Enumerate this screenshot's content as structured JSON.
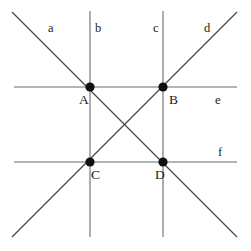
{
  "figure": {
    "canvas": {
      "width": 251,
      "height": 251,
      "background": "#ffffff"
    },
    "colors": {
      "line": "#6b6b6b",
      "diagonal": "#4a4a4a",
      "point": "#111111",
      "text": "#1a1a1a"
    },
    "lines": [
      {
        "id": "a",
        "label": "a",
        "kind": "diagonal",
        "x1": 12,
        "y1": 12,
        "x2": 237,
        "y2": 237
      },
      {
        "id": "b",
        "label": "b",
        "kind": "vertical",
        "x1": 90,
        "y1": 11,
        "x2": 90,
        "y2": 237
      },
      {
        "id": "c",
        "label": "c",
        "kind": "vertical",
        "x1": 163,
        "y1": 11,
        "x2": 163,
        "y2": 237
      },
      {
        "id": "d",
        "label": "d",
        "kind": "diagonal",
        "x1": 12,
        "y1": 237,
        "x2": 237,
        "y2": 12
      },
      {
        "id": "e",
        "label": "e",
        "kind": "horizontal",
        "x1": 14,
        "y1": 87,
        "x2": 237,
        "y2": 87
      },
      {
        "id": "f",
        "label": "f",
        "kind": "horizontal",
        "x1": 14,
        "y1": 162,
        "x2": 237,
        "y2": 162
      }
    ],
    "line_labels": [
      {
        "id": "label-a",
        "text": "a",
        "x": 48,
        "y": 22
      },
      {
        "id": "label-b",
        "text": "b",
        "x": 95,
        "y": 22
      },
      {
        "id": "label-c",
        "text": "c",
        "x": 153,
        "y": 22
      },
      {
        "id": "label-d",
        "text": "d",
        "x": 204,
        "y": 22
      },
      {
        "id": "label-e",
        "text": "e",
        "x": 215,
        "y": 94
      },
      {
        "id": "label-f",
        "text": "f",
        "x": 218,
        "y": 146
      }
    ],
    "points": [
      {
        "id": "A",
        "label": "A",
        "x": 90,
        "y": 87,
        "r": 4.6,
        "label_x": 79,
        "label_y": 93
      },
      {
        "id": "B",
        "label": "B",
        "x": 163,
        "y": 87,
        "r": 4.6,
        "label_x": 169,
        "label_y": 93
      },
      {
        "id": "C",
        "label": "C",
        "x": 90,
        "y": 162,
        "r": 4.6,
        "label_x": 91,
        "label_y": 168
      },
      {
        "id": "D",
        "label": "D",
        "x": 163,
        "y": 162,
        "r": 4.6,
        "label_x": 155,
        "label_y": 168
      }
    ]
  }
}
